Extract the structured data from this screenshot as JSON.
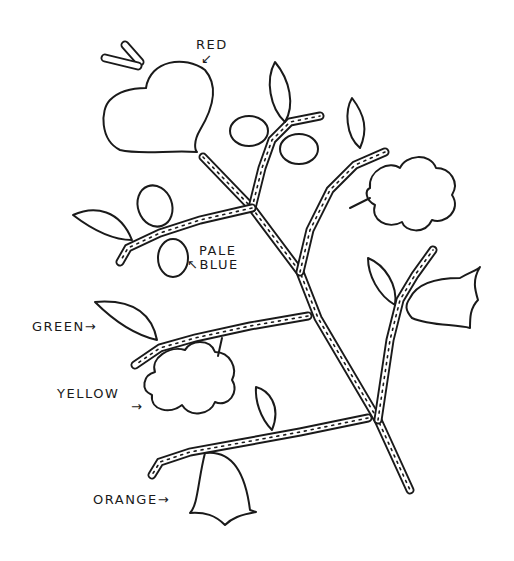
{
  "figure": {
    "type": "embroidery-pattern-line-drawing",
    "ink_color": "#1a1a1a",
    "background_color": "#ffffff",
    "labels": [
      {
        "id": "red",
        "text": "RED",
        "arrow": "↙",
        "target": "heart-flower"
      },
      {
        "id": "pale-blue",
        "line1": "PALE",
        "line2": "BLUE",
        "arrow": "↖",
        "target": "oval-bud"
      },
      {
        "id": "green",
        "text": "GREEN",
        "arrow": "→",
        "target": "leaf"
      },
      {
        "id": "yellow",
        "text": "YELLOW",
        "arrow": "→",
        "target": "scalloped-flower"
      },
      {
        "id": "orange",
        "text": "ORANGE",
        "arrow": "→",
        "target": "bell-flower"
      }
    ]
  }
}
